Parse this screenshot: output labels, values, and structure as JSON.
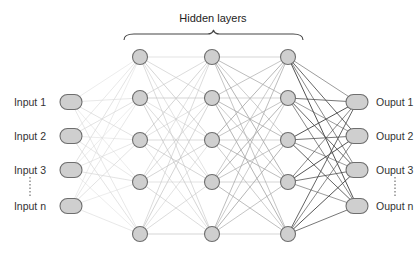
{
  "title": "Hidden layers",
  "colors": {
    "node_fill": "#cfcfcf",
    "node_stroke": "#6e6e6e",
    "edge_light": "#d8d8d8",
    "edge_mid": "#a8a8a8",
    "edge_dark": "#4a4a4a",
    "text": "#333333"
  },
  "inputs": {
    "x": 71,
    "labels": [
      "Input 1",
      "Input 2",
      "Input 3",
      "Input n"
    ],
    "ys": [
      102,
      136,
      170,
      206
    ]
  },
  "hidden_layers": [
    {
      "x": 140,
      "ys": [
        57,
        98,
        140,
        182,
        234
      ]
    },
    {
      "x": 212,
      "ys": [
        57,
        98,
        140,
        182,
        234
      ]
    },
    {
      "x": 288,
      "ys": [
        57,
        98,
        140,
        182,
        234
      ]
    }
  ],
  "outputs": {
    "x": 357,
    "labels": [
      "Ouput 1",
      "Ouput 2",
      "Ouput 3",
      "Ouput n"
    ],
    "ys": [
      102,
      136,
      170,
      206
    ]
  },
  "brace": {
    "x1": 124,
    "x2": 303,
    "y": 40,
    "tip_y": 30
  }
}
